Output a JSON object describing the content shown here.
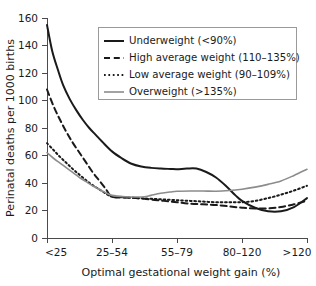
{
  "chart_data": {
    "type": "line",
    "title": "",
    "subtitle": "",
    "xlabel": "Optimal gestational weight gain (%)",
    "ylabel": "Perinatal deaths per 1000 births",
    "categories": [
      "<25",
      "25–54",
      "55–79",
      "80–120",
      ">120"
    ],
    "xticklabels": [
      "<25",
      "25–54",
      "55–79",
      "80–120",
      ">120"
    ],
    "yticklabels": [
      "0",
      "20",
      "40",
      "60",
      "80",
      "100",
      "120",
      "140",
      "160"
    ],
    "ytickvalues": [
      0,
      20,
      40,
      60,
      80,
      100,
      120,
      140,
      160
    ],
    "ylim": [
      0,
      160
    ],
    "xlim": [
      0,
      4
    ],
    "grid": false,
    "legend_position": "upper-right",
    "series": [
      {
        "name": "Underweight (<90%)",
        "style": "solid",
        "color": "#1a1a1a",
        "width": 2.0,
        "values": [
          155,
          51,
          50,
          19,
          29
        ],
        "dense_x": [
          0.0,
          0.08,
          0.17,
          0.25,
          0.35,
          0.45,
          0.55,
          0.65,
          0.75,
          0.85,
          1.0,
          1.15,
          1.3,
          1.45,
          1.6,
          1.75,
          1.9,
          2.0,
          2.15,
          2.3,
          2.45,
          2.6,
          2.75,
          2.9,
          3.0,
          3.2,
          3.4,
          3.6,
          3.8,
          4.0
        ],
        "dense_y": [
          155,
          136,
          122,
          111,
          101,
          93,
          86,
          80,
          75,
          70,
          63,
          58,
          54,
          52,
          51,
          50.5,
          50.2,
          50,
          50.5,
          50.5,
          48,
          44,
          38,
          31,
          27,
          22,
          19.5,
          19.5,
          22.5,
          29
        ]
      },
      {
        "name": "High average weight (110–135%)",
        "style": "dashed",
        "color": "#1a1a1a",
        "width": 2.0,
        "values": [
          108,
          30,
          26,
          22,
          27
        ],
        "dense_x": [
          0.0,
          0.1,
          0.2,
          0.3,
          0.4,
          0.5,
          0.6,
          0.7,
          0.8,
          0.9,
          1.0,
          1.2,
          1.4,
          1.6,
          1.8,
          2.0,
          2.2,
          2.4,
          2.6,
          2.8,
          3.0,
          3.2,
          3.4,
          3.6,
          3.8,
          4.0
        ],
        "dense_y": [
          108,
          96,
          86,
          77,
          69,
          62,
          55,
          48,
          42,
          36,
          30,
          29.5,
          29,
          28,
          27,
          26,
          25,
          24.5,
          24,
          23,
          22,
          21.5,
          21.5,
          22.5,
          24.5,
          27
        ]
      },
      {
        "name": "Low average weight (90–109%)",
        "style": "dotted",
        "color": "#1a1a1a",
        "width": 2.0,
        "values": [
          69,
          30,
          27,
          26,
          38
        ],
        "dense_x": [
          0.0,
          0.1,
          0.2,
          0.3,
          0.4,
          0.5,
          0.6,
          0.7,
          0.8,
          0.9,
          1.0,
          1.2,
          1.4,
          1.6,
          1.8,
          2.0,
          2.2,
          2.4,
          2.6,
          2.8,
          3.0,
          3.2,
          3.4,
          3.6,
          3.8,
          4.0
        ],
        "dense_y": [
          69,
          64,
          59,
          54.5,
          50,
          46,
          42,
          38.5,
          35.5,
          32.5,
          30,
          29.5,
          29,
          28.5,
          28,
          27.5,
          27,
          26.5,
          26,
          26,
          26,
          27,
          29,
          31.5,
          34.5,
          38
        ]
      },
      {
        "name": "Overweight (>135%)",
        "style": "solid",
        "color": "#8c8c8c",
        "width": 1.6,
        "values": [
          62,
          31,
          34,
          36,
          50
        ],
        "dense_x": [
          0.0,
          0.1,
          0.2,
          0.3,
          0.4,
          0.5,
          0.6,
          0.7,
          0.8,
          0.9,
          1.0,
          1.2,
          1.4,
          1.5,
          1.6,
          1.75,
          1.9,
          2.0,
          2.2,
          2.4,
          2.6,
          2.8,
          3.0,
          3.2,
          3.4,
          3.6,
          3.8,
          4.0
        ],
        "dense_y": [
          62,
          58,
          54.5,
          51,
          47.5,
          44,
          41,
          38,
          35.5,
          33,
          31,
          30,
          29.8,
          30,
          31,
          32.5,
          33.5,
          34,
          34.2,
          34.2,
          34,
          34.5,
          35.5,
          37,
          39,
          41.5,
          45.5,
          50
        ]
      }
    ]
  },
  "legend": {
    "items": [
      {
        "label": "Underweight (<90%)"
      },
      {
        "label": "High average weight (110–135%)"
      },
      {
        "label": "Low average weight (90–109%)"
      },
      {
        "label": "Overweight (>135%)"
      }
    ]
  }
}
